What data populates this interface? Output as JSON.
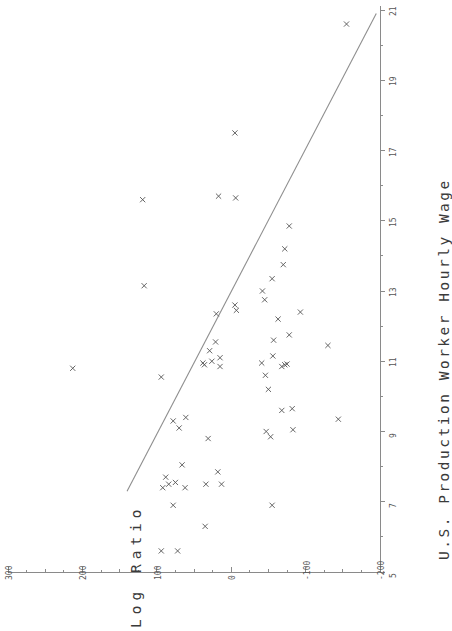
{
  "chart_data": {
    "type": "scatter",
    "title": "",
    "orientation": "rotated-90-ccw",
    "xlabel": "U.S. Production Worker Hourly Wage",
    "ylabel": "Log Ratio",
    "xlim": [
      5,
      21
    ],
    "ylim": [
      -200,
      300
    ],
    "xticks": [
      5,
      7,
      9,
      11,
      13,
      15,
      17,
      19,
      21
    ],
    "xticklabels": [
      "5",
      "7",
      "9",
      "11",
      "13",
      "15",
      "17",
      "19",
      "21"
    ],
    "xminorticks": [
      6,
      8,
      10,
      12,
      14,
      16,
      18,
      20
    ],
    "yticks": [
      300,
      200,
      100,
      0,
      -100,
      -200
    ],
    "yticklabels": [
      "300",
      "200",
      "100",
      "0",
      "-100",
      "-200"
    ],
    "yminorticks": [
      250,
      150,
      50,
      -50,
      -150
    ],
    "grid": false,
    "legend": null,
    "marker": "x",
    "marker_color": "#555555",
    "line_color": "#8e8e8e",
    "axis_color": "#8a8a8a",
    "fit_line": {
      "label": "regression line",
      "x": [
        7.3,
        20.9
      ],
      "y": [
        140,
        -195
      ]
    },
    "points": [
      {
        "x": 5.6,
        "y": 94
      },
      {
        "x": 5.6,
        "y": 72
      },
      {
        "x": 6.3,
        "y": 35
      },
      {
        "x": 6.9,
        "y": 78
      },
      {
        "x": 6.9,
        "y": -55
      },
      {
        "x": 7.4,
        "y": 92
      },
      {
        "x": 7.4,
        "y": 62
      },
      {
        "x": 7.5,
        "y": 84
      },
      {
        "x": 7.5,
        "y": 13
      },
      {
        "x": 7.5,
        "y": 34
      },
      {
        "x": 7.55,
        "y": 75
      },
      {
        "x": 7.7,
        "y": 88
      },
      {
        "x": 7.85,
        "y": 18
      },
      {
        "x": 8.05,
        "y": 66
      },
      {
        "x": 8.8,
        "y": 31
      },
      {
        "x": 8.85,
        "y": -53
      },
      {
        "x": 9.0,
        "y": -47
      },
      {
        "x": 9.05,
        "y": -83
      },
      {
        "x": 9.1,
        "y": 70
      },
      {
        "x": 9.3,
        "y": 78
      },
      {
        "x": 9.35,
        "y": -144
      },
      {
        "x": 9.4,
        "y": 61
      },
      {
        "x": 9.6,
        "y": -68
      },
      {
        "x": 9.65,
        "y": -82
      },
      {
        "x": 10.2,
        "y": -50
      },
      {
        "x": 10.55,
        "y": 94
      },
      {
        "x": 10.6,
        "y": -46
      },
      {
        "x": 10.8,
        "y": 213
      },
      {
        "x": 10.85,
        "y": 15
      },
      {
        "x": 10.85,
        "y": -68
      },
      {
        "x": 10.9,
        "y": -72
      },
      {
        "x": 10.9,
        "y": 36
      },
      {
        "x": 10.92,
        "y": -75
      },
      {
        "x": 10.95,
        "y": 38
      },
      {
        "x": 10.95,
        "y": -41
      },
      {
        "x": 11.0,
        "y": 26
      },
      {
        "x": 11.1,
        "y": 15
      },
      {
        "x": 11.15,
        "y": -56
      },
      {
        "x": 11.3,
        "y": 29
      },
      {
        "x": 11.45,
        "y": -130
      },
      {
        "x": 11.55,
        "y": 21
      },
      {
        "x": 11.6,
        "y": -57
      },
      {
        "x": 11.75,
        "y": -78
      },
      {
        "x": 12.2,
        "y": -63
      },
      {
        "x": 12.35,
        "y": 20
      },
      {
        "x": 12.4,
        "y": -93
      },
      {
        "x": 12.45,
        "y": -7
      },
      {
        "x": 12.6,
        "y": -5
      },
      {
        "x": 12.75,
        "y": -45
      },
      {
        "x": 13.0,
        "y": -42
      },
      {
        "x": 13.15,
        "y": 117
      },
      {
        "x": 13.35,
        "y": -55
      },
      {
        "x": 13.75,
        "y": -70
      },
      {
        "x": 14.2,
        "y": -72
      },
      {
        "x": 14.85,
        "y": -78
      },
      {
        "x": 15.6,
        "y": 119
      },
      {
        "x": 15.65,
        "y": -6
      },
      {
        "x": 15.7,
        "y": 17
      },
      {
        "x": 17.5,
        "y": -5
      },
      {
        "x": 20.6,
        "y": -155
      }
    ]
  }
}
